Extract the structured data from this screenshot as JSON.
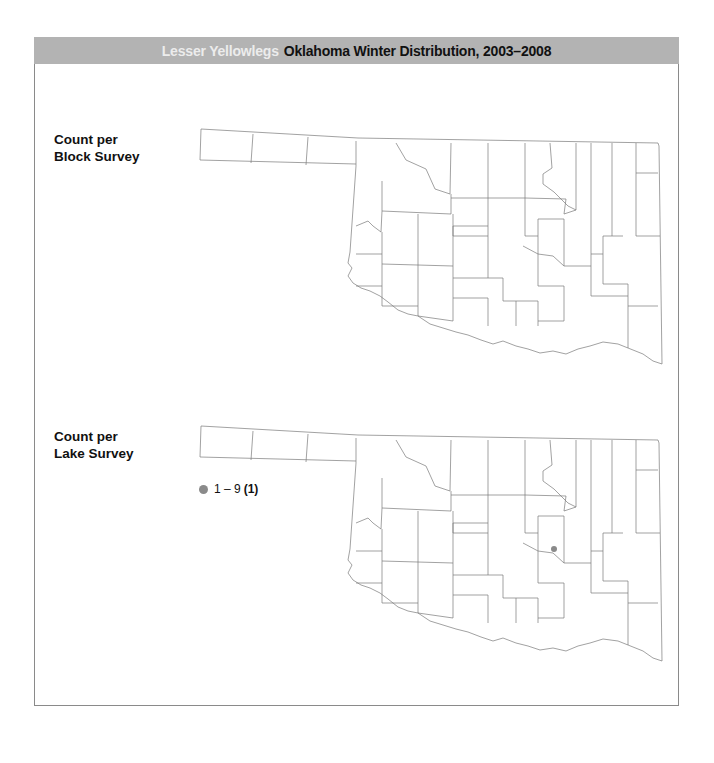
{
  "header": {
    "species": "Lesser Yellowlegs",
    "title": "Oklahoma Winter Distribution, 2003–2008",
    "background_color": "#b3b3b3",
    "species_color": "#ececec"
  },
  "panels": [
    {
      "label_line1": "Count per",
      "label_line2": "Block Survey",
      "map": "Oklahoma county outline map",
      "points": []
    },
    {
      "label_line1": "Count per",
      "label_line2": "Lake Survey",
      "map": "Oklahoma county outline map",
      "legend": {
        "range": "1 – 9",
        "count": "(1)",
        "dot_color": "#8a8a8a"
      },
      "points": [
        {
          "x_px": 554,
          "y_px": 549,
          "count_class": "1 – 9"
        }
      ]
    }
  ]
}
